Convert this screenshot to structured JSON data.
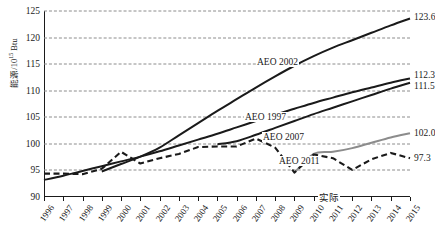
{
  "axes": {
    "ylabel_text": "能源/10",
    "ylabel_exp": "15",
    "ylabel_unit": " Btu",
    "yticks": [
      "90",
      "95",
      "100",
      "105",
      "110",
      "115",
      "120",
      "125"
    ],
    "xticks": [
      "1996",
      "1997",
      "1998",
      "1999",
      "2000",
      "2001",
      "2002",
      "2003",
      "2004",
      "2005",
      "2006",
      "2007",
      "2008",
      "2009",
      "2010",
      "2011",
      "2012",
      "2013",
      "2014",
      "2015"
    ]
  },
  "annotations": {
    "aeo2002": "AEO 2002",
    "aeo1997": "AEO 1997",
    "aeo2007": "AEO 2007",
    "aeo2011": "AEO 2011",
    "actual": "实际"
  },
  "endlabels": {
    "aeo2002": "123.6",
    "aeo1997": "112.3",
    "aeo2007": "111.5",
    "aeo2011": "102.0",
    "actual": "97.3"
  },
  "colors": {
    "black": "#1a1a1a",
    "gray": "#8c8c8c",
    "grid": "#8c8c8c"
  },
  "chart_data": {
    "type": "line",
    "title": "",
    "xlabel": "",
    "ylabel": "能源/10^15 Btu",
    "xlim": [
      1996,
      2015
    ],
    "ylim": [
      90,
      125
    ],
    "grid": true,
    "legend": "inline-annotations",
    "x": [
      1996,
      1997,
      1998,
      1999,
      2000,
      2001,
      2002,
      2003,
      2004,
      2005,
      2006,
      2007,
      2008,
      2009,
      2010,
      2011,
      2012,
      2013,
      2014,
      2015
    ],
    "series": [
      {
        "name": "AEO 2002",
        "style": "solid-black",
        "end_value": 123.6,
        "x": [
          1999,
          2000,
          2001,
          2002,
          2003,
          2004,
          2005,
          2006,
          2007,
          2008,
          2009,
          2010,
          2011,
          2012,
          2013,
          2014,
          2015
        ],
        "values": [
          94.8,
          96.2,
          97.6,
          99.3,
          101.6,
          103.9,
          106.2,
          108.4,
          110.6,
          112.7,
          114.7,
          116.5,
          118.1,
          119.5,
          120.9,
          122.3,
          123.6
        ]
      },
      {
        "name": "AEO 1997",
        "style": "solid-black",
        "end_value": 112.3,
        "x": [
          1996,
          1997,
          1998,
          1999,
          2000,
          2001,
          2002,
          2003,
          2004,
          2005,
          2006,
          2007,
          2008,
          2009,
          2010,
          2011,
          2012,
          2013,
          2014,
          2015
        ],
        "values": [
          93.2,
          94.0,
          94.9,
          95.8,
          96.7,
          97.6,
          98.6,
          99.7,
          100.8,
          101.9,
          103.1,
          104.3,
          105.5,
          106.6,
          107.7,
          108.7,
          109.7,
          110.6,
          111.5,
          112.3
        ]
      },
      {
        "name": "AEO 2007",
        "style": "solid-black",
        "end_value": 111.5,
        "x": [
          2005,
          2006,
          2007,
          2008,
          2009,
          2010,
          2011,
          2012,
          2013,
          2014,
          2015
        ],
        "values": [
          99.9,
          100.5,
          101.7,
          103.0,
          104.3,
          105.6,
          106.8,
          108.0,
          109.2,
          110.4,
          111.5
        ]
      },
      {
        "name": "AEO 2011",
        "style": "solid-gray",
        "end_value": 102.0,
        "x": [
          2009,
          2010,
          2011,
          2012,
          2013,
          2014,
          2015
        ],
        "values": [
          94.6,
          98.1,
          98.5,
          99.2,
          100.2,
          101.2,
          102.0
        ]
      },
      {
        "name": "实际",
        "style": "dashed-black",
        "end_value": 97.3,
        "x": [
          1996,
          1997,
          1998,
          1999,
          2000,
          2001,
          2002,
          2003,
          2004,
          2005,
          2006,
          2007,
          2008,
          2009,
          2010,
          2011,
          2012,
          2013,
          2014,
          2015
        ],
        "values": [
          94.4,
          94.4,
          94.3,
          95.3,
          98.5,
          96.3,
          97.3,
          98.1,
          99.4,
          99.5,
          99.5,
          101.0,
          99.3,
          94.6,
          98.0,
          97.3,
          95.1,
          97.1,
          98.3,
          97.3
        ]
      }
    ]
  }
}
